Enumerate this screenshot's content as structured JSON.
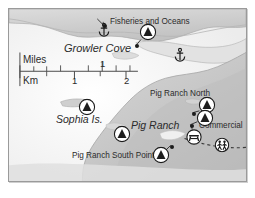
{
  "map": {
    "title": "Growler Cove area nautical / recreation map",
    "colors": {
      "water": "#ffffff",
      "land_light": "#d9d9d9",
      "land_mid": "#c4c4c4",
      "land_dark": "#b0b0b0",
      "frame_border": "#9a9a9a",
      "text": "#2b2b2b",
      "marker_stroke": "#1c1c1c",
      "trail": "#3a3a3a",
      "page_background": "#ffffff"
    },
    "labels": [
      {
        "id": "fisheries-and-oceans",
        "text": "Fisheries and Oceans",
        "x": 101,
        "y": 12,
        "size": 8.2,
        "italic": false,
        "anchor": "left"
      },
      {
        "id": "growler-cove",
        "text": "Growler Cove",
        "x": 55,
        "y": 40,
        "size": 11,
        "italic": true,
        "anchor": "left"
      },
      {
        "id": "pig-ranch-north",
        "text": "Pig Ranch North",
        "x": 141,
        "y": 85,
        "size": 8.2,
        "italic": false,
        "anchor": "left"
      },
      {
        "id": "commercial",
        "text": "Commercial",
        "x": 190,
        "y": 117,
        "size": 8.2,
        "italic": false,
        "anchor": "left"
      },
      {
        "id": "pig-ranch",
        "text": "Pig Ranch",
        "x": 122,
        "y": 116,
        "size": 10.5,
        "italic": true,
        "anchor": "left"
      },
      {
        "id": "sophia-is",
        "text": "Sophia Is.",
        "x": 47,
        "y": 110,
        "size": 10.5,
        "italic": true,
        "anchor": "left"
      },
      {
        "id": "pig-ranch-south-point",
        "text": "Pig Ranch South Point",
        "x": 63,
        "y": 147,
        "size": 8.2,
        "italic": false,
        "anchor": "left"
      }
    ],
    "scale_bar": {
      "miles_label": "Miles",
      "km_label": "Km",
      "miles_ticks": [
        {
          "label": "1",
          "x": 94
        }
      ],
      "km_ticks": [
        {
          "label": "1",
          "x": 66
        },
        {
          "label": "2",
          "x": 118
        }
      ],
      "bar_left": 11,
      "bar_right": 130,
      "bar_y": 63
    },
    "markers": [
      {
        "id": "campground-fisheries",
        "icon": "campground-triangle-icon",
        "x": 139,
        "y": 25,
        "r": 8.5
      },
      {
        "id": "campground-sophia",
        "icon": "campground-triangle-icon",
        "x": 78,
        "y": 100,
        "r": 8.5
      },
      {
        "id": "campground-mid-south",
        "icon": "campground-triangle-icon",
        "x": 113,
        "y": 127,
        "r": 8.5
      },
      {
        "id": "campground-pig-ranch-north",
        "icon": "campground-triangle-icon",
        "x": 198,
        "y": 98,
        "r": 8.5
      },
      {
        "id": "campground-commercial",
        "icon": "campground-triangle-icon",
        "x": 196,
        "y": 111,
        "r": 8.5
      },
      {
        "id": "campground-south-point",
        "icon": "campground-triangle-icon",
        "x": 152,
        "y": 148,
        "r": 8.5
      },
      {
        "id": "picnic-area",
        "icon": "picnic-table-icon",
        "x": 185,
        "y": 130,
        "r": 8
      },
      {
        "id": "trail-hikers",
        "icon": "hikers-icon",
        "x": 213,
        "y": 138,
        "r": 7.5
      },
      {
        "id": "anchorage-growler-cove",
        "icon": "anchor-icon",
        "x": 95,
        "y": 23,
        "r": 7
      },
      {
        "id": "anchorage-east-bay",
        "icon": "anchor-icon",
        "x": 171,
        "y": 48,
        "r": 7
      }
    ],
    "point_dots": [
      {
        "id": "dot-fisheries-callout",
        "x": 96,
        "y": 17
      },
      {
        "id": "dot-fisheries-site",
        "x": 128,
        "y": 37
      },
      {
        "id": "dot-pig-ranch-north-site",
        "x": 185,
        "y": 105
      },
      {
        "id": "dot-commercial-site",
        "x": 183,
        "y": 117
      },
      {
        "id": "dot-south-point-site",
        "x": 163,
        "y": 138
      }
    ]
  }
}
